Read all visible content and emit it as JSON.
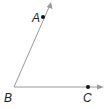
{
  "diagram": {
    "type": "angle",
    "name": "angle ABC",
    "colors": {
      "ray": "#9a9a9a",
      "point": "#111111",
      "label": "#222222"
    },
    "vertex": {
      "label": "B",
      "x": 14,
      "y": 87,
      "label_x": 4,
      "label_y": 102
    },
    "rays": [
      {
        "id": "ray-BA",
        "from": "B",
        "through": "A",
        "end": {
          "x": 51,
          "y": 3
        },
        "point": {
          "label": "A",
          "x": 43,
          "y": 17,
          "label_x": 32,
          "label_y": 22
        }
      },
      {
        "id": "ray-BC",
        "from": "B",
        "through": "C",
        "end": {
          "x": 103,
          "y": 87
        },
        "point": {
          "label": "C",
          "x": 88,
          "y": 87,
          "label_x": 83,
          "label_y": 102
        }
      }
    ]
  }
}
